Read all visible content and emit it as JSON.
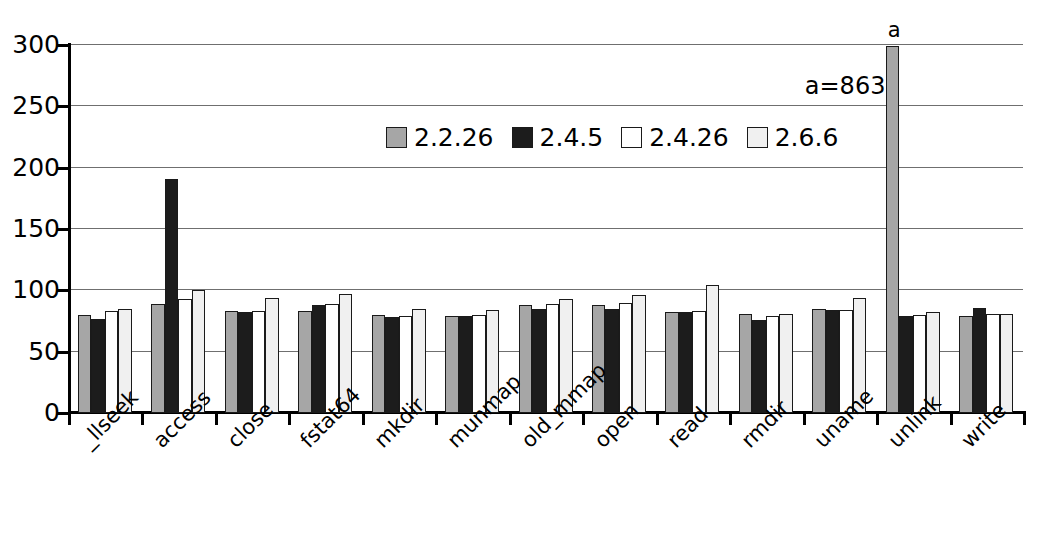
{
  "chart_data": {
    "type": "bar",
    "title": "",
    "subtitle": "",
    "xlabel": "",
    "ylabel": "",
    "ylim": [
      0,
      300
    ],
    "yticks": [
      0,
      50,
      100,
      150,
      200,
      250,
      300
    ],
    "grid": true,
    "legend_position": "inside-top-center",
    "categories": [
      "_llseek",
      "access",
      "close",
      "fstat64",
      "mkdir",
      "munmap",
      "old_mmap",
      "open",
      "read",
      "rmdir",
      "uname",
      "unlink",
      "write"
    ],
    "series": [
      {
        "name": "2.2.26",
        "color": "#a6a6a6",
        "values": [
          80,
          89,
          83,
          83,
          80,
          79,
          88,
          88,
          82,
          81,
          85,
          863,
          79
        ]
      },
      {
        "name": "2.4.5",
        "color": "#1c1c1c",
        "values": [
          77,
          191,
          82,
          88,
          78,
          79,
          85,
          85,
          82,
          76,
          84,
          79,
          86
        ]
      },
      {
        "name": "2.4.26",
        "color": "#ffffff",
        "values": [
          83,
          93,
          83,
          89,
          79,
          80,
          89,
          90,
          83,
          79,
          84,
          80,
          81
        ]
      },
      {
        "name": "2.6.6",
        "color": "#f0f0f0",
        "values": [
          85,
          100,
          94,
          97,
          85,
          84,
          93,
          96,
          104,
          81,
          94,
          82,
          81
        ]
      }
    ],
    "annotations": [
      {
        "marker": "a",
        "note": "a=863",
        "category": "unlink",
        "series": "2.2.26",
        "actual_value": 863,
        "clipped_to": 299
      }
    ]
  }
}
